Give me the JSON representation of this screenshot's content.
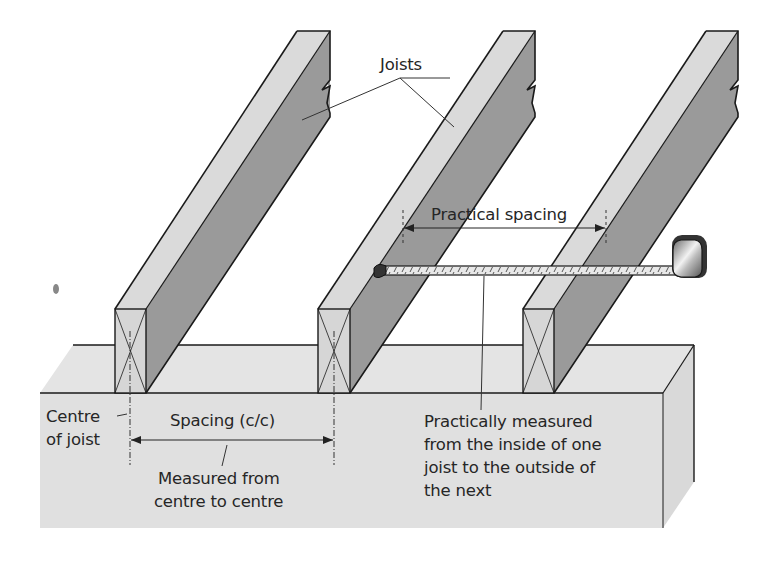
{
  "diagram": {
    "title": "Joist spacing",
    "labels": {
      "joists": "Joists",
      "practical_spacing": "Practical spacing",
      "centre_of_joist_line1": "Centre",
      "centre_of_joist_line2": "of joist",
      "spacing_cc": "Spacing (c/c)",
      "measured_cc_line1": "Measured from",
      "measured_cc_line2": "centre to centre",
      "practical_note_line1": "Practically measured",
      "practical_note_line2": "from the inside of one",
      "practical_note_line3": "joist to the outside of",
      "practical_note_line4": "the next"
    },
    "components": [
      {
        "name": "joist",
        "count": 3,
        "description": "Timber joists resting on wall plate, end grain shown with X cross"
      },
      {
        "name": "wall-plate",
        "description": "Light grey block supporting joists"
      },
      {
        "name": "tape-measure",
        "description": "Tape measure hooked on inside face of middle joist"
      },
      {
        "name": "dimension-spacing-cc",
        "description": "Centre-to-centre spacing dimension arrow"
      },
      {
        "name": "dimension-practical-spacing",
        "description": "Inside-to-outside practical spacing dimension arrow"
      }
    ],
    "colors": {
      "joist_top_face": "#d9d9d9",
      "joist_side_face": "#9a9a9a",
      "joist_end_face": "#d6d6d6",
      "wall_plate": "#e2e2e2",
      "wall_plate_side": "#d8d8d8",
      "outline": "#1a1a1a",
      "background": "#ffffff"
    }
  }
}
